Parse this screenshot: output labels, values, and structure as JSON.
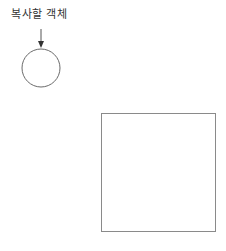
{
  "diagram": {
    "label": "복사할 객체",
    "colors": {
      "background": "#ffffff",
      "stroke": "#6b6b6b",
      "arrow": "#333333",
      "text": "#333333"
    },
    "arrow": {
      "x": 41,
      "y1": 29,
      "y2": 48
    },
    "circle": {
      "cx": 41,
      "cy": 68,
      "r": 19
    },
    "square": {
      "x": 101,
      "y": 113,
      "width": 114,
      "height": 118
    }
  }
}
